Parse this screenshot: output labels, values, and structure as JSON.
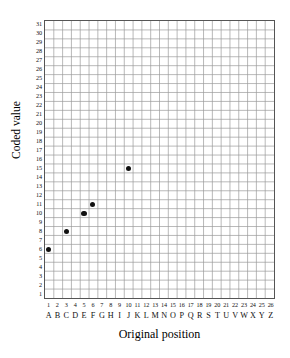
{
  "chart_data": {
    "type": "scatter",
    "title": "",
    "xlabel": "Original position",
    "ylabel": "Coded value",
    "xlim": [
      0,
      26
    ],
    "ylim": [
      0,
      31
    ],
    "grid": true,
    "legend": null,
    "x_tick_numbers": [
      "1",
      "2",
      "3",
      "4",
      "5",
      "6",
      "7",
      "8",
      "9",
      "10",
      "11",
      "12",
      "13",
      "14",
      "15",
      "16",
      "17",
      "18",
      "19",
      "20",
      "21",
      "22",
      "23",
      "24",
      "25",
      "26"
    ],
    "x_tick_letters": [
      "A",
      "B",
      "C",
      "D",
      "E",
      "F",
      "G",
      "H",
      "I",
      "J",
      "K",
      "L",
      "M",
      "N",
      "O",
      "P",
      "Q",
      "R",
      "S",
      "T",
      "U",
      "V",
      "W",
      "X",
      "Y",
      "Z"
    ],
    "y_tick_labels": [
      "1",
      "2",
      "3",
      "4",
      "5",
      "6",
      "7",
      "8",
      "9",
      "10",
      "11",
      "12",
      "13",
      "14",
      "15",
      "16",
      "17",
      "18",
      "19",
      "20",
      "21",
      "22",
      "23",
      "24",
      "25",
      "26",
      "27",
      "28",
      "29",
      "30",
      "31"
    ],
    "points": [
      {
        "x": 1,
        "letter": "A",
        "y": 6
      },
      {
        "x": 3,
        "letter": "C",
        "y": 8
      },
      {
        "x": 5,
        "letter": "E",
        "y": 10
      },
      {
        "x": 6,
        "letter": "F",
        "y": 11
      },
      {
        "x": 10,
        "letter": "J",
        "y": 15
      }
    ],
    "marker_color": "#111111",
    "grid_color": "#9a9a9a",
    "frame_color": "#555555"
  }
}
